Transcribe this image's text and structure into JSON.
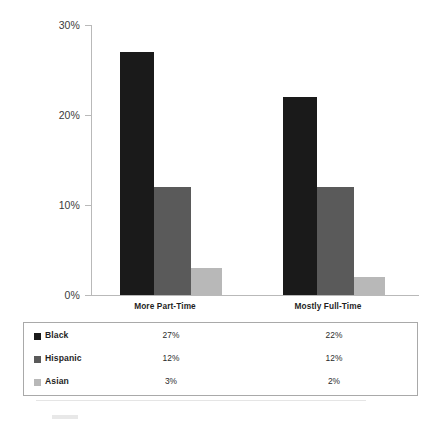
{
  "chart_data": {
    "type": "bar",
    "title": "",
    "subtitle": "",
    "xlabel": "",
    "ylabel": "",
    "categories": [
      "More Part-Time",
      "Mostly Full-Time"
    ],
    "series": [
      {
        "name": "Black",
        "values": [
          27,
          22
        ],
        "labels": [
          "27%",
          "22%"
        ],
        "color": "#1a1a1a"
      },
      {
        "name": "Hispanic",
        "values": [
          12,
          12
        ],
        "labels": [
          "12%",
          "12%"
        ],
        "color": "#5a5a5a"
      },
      {
        "name": "Asian",
        "values": [
          3,
          2
        ],
        "labels": [
          "3%",
          "2%"
        ],
        "color": "#b8b8b8"
      }
    ],
    "ylim": [
      0,
      30
    ],
    "y_ticks": [
      0,
      10,
      20,
      30
    ],
    "y_tick_labels": [
      "0%",
      "10%",
      "20%",
      "30%"
    ],
    "grid": false,
    "legend_position": "bottom-table",
    "value_suffix": "%"
  },
  "axis": {
    "y_labels": [
      "30%",
      "20%",
      "10%",
      "0%"
    ],
    "line_color": "#b9b9b9"
  },
  "legend_table": {
    "rows": [
      {
        "name": "Black",
        "swatch": "legend-swatch-black",
        "color": "#1a1a1a",
        "values": [
          "27%",
          "22%"
        ]
      },
      {
        "name": "Hispanic",
        "swatch": "legend-swatch-hispanic",
        "color": "#5a5a5a",
        "values": [
          "12%",
          "12%"
        ]
      },
      {
        "name": "Asian",
        "swatch": "legend-swatch-asian",
        "color": "#b8b8b8",
        "values": [
          "3%",
          "2%"
        ]
      }
    ],
    "border_color": "#a9a9a9"
  }
}
